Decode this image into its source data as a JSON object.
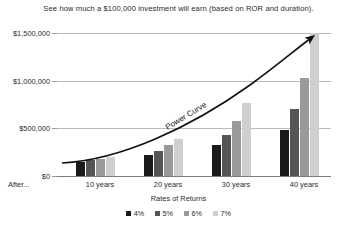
{
  "chart_data": {
    "type": "bar",
    "title": "See how much a $100,000 investment will earn (based on ROR and duration).",
    "xlabel": "Rates of Returns",
    "ylabel": "",
    "categories": [
      "10 years",
      "20 years",
      "30 years",
      "40 years"
    ],
    "series": [
      {
        "name": "4%",
        "color": "#1a1a1a",
        "values": [
          148000,
          219000,
          324000,
          480000
        ]
      },
      {
        "name": "5%",
        "color": "#555555",
        "values": [
          163000,
          265000,
          432000,
          704000
        ]
      },
      {
        "name": "6%",
        "color": "#9a9a9a",
        "values": [
          179000,
          321000,
          574000,
          1029000
        ]
      },
      {
        "name": "7%",
        "color": "#cfcfcf",
        "values": [
          197000,
          387000,
          761000,
          1497000
        ]
      }
    ],
    "ylim": [
      0,
      1500000
    ],
    "yticks": [
      0,
      500000,
      1000000,
      1500000
    ],
    "ytick_labels": [
      "$0",
      "$500,000",
      "$1,000,000",
      "$1,500,000"
    ],
    "grid": true,
    "legend_position": "bottom",
    "annotations": [
      {
        "name": "power-curve",
        "text": "Power Curve",
        "style": "upward arrow overlay"
      }
    ],
    "axis_prefix_label": "After..."
  },
  "colors": {
    "series_4pct": "#1a1a1a",
    "series_5pct": "#555555",
    "series_6pct": "#9a9a9a",
    "series_7pct": "#cfcfcf",
    "gridline": "#b9b9b9",
    "axis": "#7d7d7d",
    "text": "#2b2b2b",
    "curve": "#111111"
  }
}
